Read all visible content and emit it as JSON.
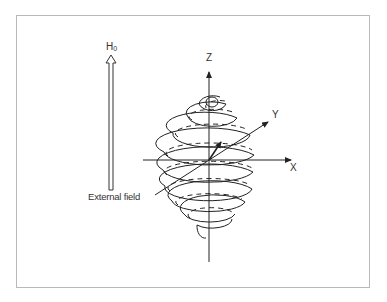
{
  "diagram": {
    "field_arrow": {
      "label_main": "H",
      "label_sub": "0",
      "caption": "External field"
    },
    "axes": {
      "x_label": "X",
      "y_label": "Y",
      "z_label": "Z"
    },
    "colors": {
      "line": "#222222",
      "frame": "#b9b9b9",
      "background": "#ffffff"
    }
  }
}
